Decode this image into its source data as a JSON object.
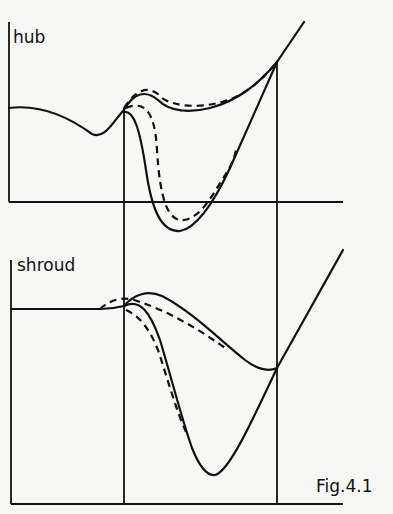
{
  "figure": {
    "caption": "Fig.4.1",
    "panels": [
      {
        "label": "hub"
      },
      {
        "label": "shroud"
      }
    ]
  },
  "colors": {
    "ink": "#111111",
    "paper": "#f7f7f5"
  }
}
